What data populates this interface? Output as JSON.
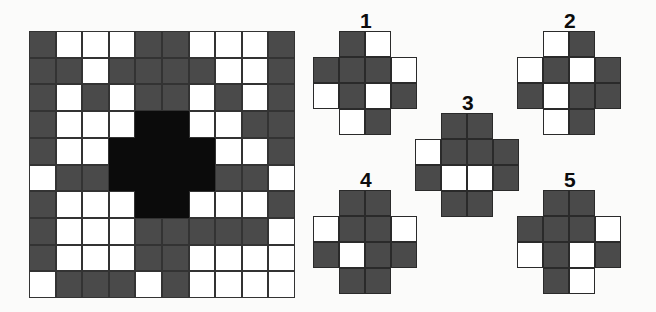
{
  "puzzle": {
    "type": "visual-pattern-matrix-puzzle",
    "colors": {
      "gray": "#4a4a4a",
      "white": "#ffffff",
      "black": "#0b0b0b",
      "border": "#2a2a2a",
      "background": "#fbfbfa"
    },
    "matrix": {
      "name": "main-pattern-grid",
      "rows": 10,
      "cols": 10,
      "legend": {
        "G": "gray",
        "W": "white",
        "B": "black"
      },
      "cells": [
        [
          "G",
          "W",
          "W",
          "W",
          "G",
          "G",
          "W",
          "W",
          "W",
          "G"
        ],
        [
          "G",
          "G",
          "W",
          "G",
          "G",
          "G",
          "G",
          "W",
          "W",
          "G"
        ],
        [
          "G",
          "W",
          "G",
          "W",
          "G",
          "G",
          "W",
          "G",
          "W",
          "G"
        ],
        [
          "G",
          "W",
          "W",
          "W",
          "B",
          "B",
          "W",
          "W",
          "G",
          "G"
        ],
        [
          "G",
          "W",
          "W",
          "B",
          "B",
          "B",
          "B",
          "W",
          "W",
          "G"
        ],
        [
          "W",
          "G",
          "G",
          "B",
          "B",
          "B",
          "B",
          "G",
          "G",
          "W"
        ],
        [
          "G",
          "W",
          "W",
          "W",
          "B",
          "B",
          "W",
          "W",
          "W",
          "G"
        ],
        [
          "G",
          "W",
          "W",
          "W",
          "G",
          "G",
          "G",
          "G",
          "G",
          "W"
        ],
        [
          "G",
          "W",
          "W",
          "W",
          "G",
          "G",
          "W",
          "W",
          "W",
          "W"
        ],
        [
          "W",
          "G",
          "G",
          "G",
          "W",
          "G",
          "W",
          "W",
          "W",
          "W"
        ]
      ]
    },
    "options": [
      {
        "label": "1",
        "name": "answer-option-1",
        "left": 313,
        "top": 31,
        "label_left": 360,
        "label_top": 10,
        "cells": [
          [
            "N",
            "G",
            "W",
            "N"
          ],
          [
            "G",
            "G",
            "G",
            "W"
          ],
          [
            "W",
            "G",
            "W",
            "G"
          ],
          [
            "N",
            "W",
            "G",
            "N"
          ]
        ]
      },
      {
        "label": "2",
        "name": "answer-option-2",
        "left": 517,
        "top": 31,
        "label_left": 564,
        "label_top": 10,
        "cells": [
          [
            "N",
            "W",
            "G",
            "N"
          ],
          [
            "W",
            "G",
            "W",
            "G"
          ],
          [
            "G",
            "W",
            "G",
            "G"
          ],
          [
            "N",
            "W",
            "G",
            "N"
          ]
        ]
      },
      {
        "label": "3",
        "name": "answer-option-3",
        "left": 415,
        "top": 113,
        "label_left": 462,
        "label_top": 92,
        "cells": [
          [
            "N",
            "G",
            "G",
            "N"
          ],
          [
            "W",
            "G",
            "G",
            "G"
          ],
          [
            "G",
            "W",
            "W",
            "G"
          ],
          [
            "N",
            "G",
            "G",
            "N"
          ]
        ]
      },
      {
        "label": "4",
        "name": "answer-option-4",
        "left": 313,
        "top": 190,
        "label_left": 360,
        "label_top": 169,
        "cells": [
          [
            "N",
            "G",
            "G",
            "N"
          ],
          [
            "W",
            "G",
            "G",
            "W"
          ],
          [
            "G",
            "W",
            "G",
            "G"
          ],
          [
            "N",
            "G",
            "G",
            "N"
          ]
        ]
      },
      {
        "label": "5",
        "name": "answer-option-5",
        "left": 517,
        "top": 190,
        "label_left": 564,
        "label_top": 169,
        "cells": [
          [
            "N",
            "G",
            "G",
            "N"
          ],
          [
            "G",
            "G",
            "G",
            "W"
          ],
          [
            "W",
            "G",
            "W",
            "G"
          ],
          [
            "N",
            "G",
            "W",
            "N"
          ]
        ]
      }
    ]
  }
}
